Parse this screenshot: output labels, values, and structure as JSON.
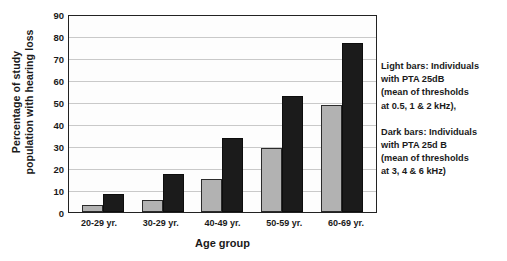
{
  "chart_data": {
    "type": "bar",
    "title": "",
    "xlabel": "Age group",
    "ylabel": "Percentage of study population with hearing loss",
    "ylabel_lines": [
      "Percentage of study",
      "population with hearing loss"
    ],
    "categories": [
      "20-29 yr.",
      "30-29 yr.",
      "40-49 yr.",
      "50-59 yr.",
      "60-69 yr."
    ],
    "series": [
      {
        "name": "Light bars",
        "color": "#b2b2b2",
        "values": [
          3,
          5.5,
          15,
          29.5,
          49
        ]
      },
      {
        "name": "Dark bars",
        "color": "#1b1b1b",
        "values": [
          8.5,
          17.5,
          34,
          53.5,
          77.5
        ]
      }
    ],
    "ylim": [
      0,
      90
    ],
    "ytick_labels": [
      "90",
      "80",
      "70",
      "60",
      "50",
      "40",
      "30",
      "20",
      "10",
      "0"
    ],
    "ytick_values": [
      90,
      80,
      70,
      60,
      50,
      40,
      30,
      20,
      10,
      0
    ],
    "grid": "horizontal",
    "legend_position": "right-outside"
  },
  "legend": {
    "blocks": [
      {
        "lines": [
          "Light bars: Individuals",
          "with PTA   25dB",
          "(mean of thresholds",
          "at 0.5, 1 & 2 kHz),"
        ]
      },
      {
        "lines": [
          "Dark bars: Individuals",
          "with PTA   25d B",
          "(mean of thresholds",
          "at 3, 4 & 6 kHz)"
        ]
      }
    ]
  }
}
